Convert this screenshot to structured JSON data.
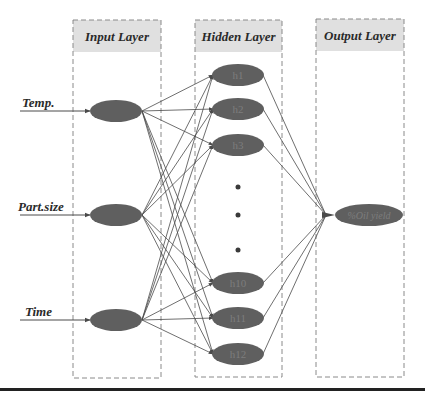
{
  "layers": {
    "input": {
      "title": "Input Layer",
      "box": {
        "x": 73,
        "y": 20,
        "w": 88,
        "h": 358
      },
      "header_h": 32
    },
    "hidden": {
      "title": "Hidden Layer",
      "box": {
        "x": 195,
        "y": 20,
        "w": 87,
        "h": 357
      },
      "header_h": 32
    },
    "output": {
      "title": "Output Layer",
      "box": {
        "x": 316,
        "y": 19,
        "w": 88,
        "h": 358
      },
      "header_h": 32
    }
  },
  "inputs": [
    {
      "label": "Temp.",
      "cx": 116,
      "cy": 111,
      "label_x": 22,
      "line_x1": 20
    },
    {
      "label": "Part.size",
      "cx": 116,
      "cy": 215,
      "label_x": 18,
      "line_x1": 20
    },
    {
      "label": "Time",
      "cx": 116,
      "cy": 320,
      "label_x": 25,
      "line_x1": 20
    }
  ],
  "hidden_nodes": [
    {
      "label": "h1",
      "cx": 238,
      "cy": 75
    },
    {
      "label": "h2",
      "cx": 238,
      "cy": 109
    },
    {
      "label": "h3",
      "cx": 238,
      "cy": 145
    },
    {
      "label": "h10",
      "cx": 238,
      "cy": 283
    },
    {
      "label": "h11",
      "cx": 238,
      "cy": 318
    },
    {
      "label": "h12",
      "cx": 238,
      "cy": 354
    }
  ],
  "ellipsis_dots": [
    {
      "cx": 238,
      "cy": 187
    },
    {
      "cx": 238,
      "cy": 215
    },
    {
      "cx": 238,
      "cy": 250
    }
  ],
  "output_node": {
    "label": "%Oil yield",
    "cx": 369,
    "cy": 215,
    "rx": 34,
    "ry": 11,
    "junction_x": 326
  },
  "node_style": {
    "rx": 26,
    "ry": 11,
    "fill": "#5f5f5f",
    "header_fill": "#e0e0e0",
    "line": "#4a4a4a",
    "box_stroke": "#8a8a8a"
  },
  "bottom_rule": {
    "y": 388,
    "thickness": 3,
    "color": "#222222"
  }
}
